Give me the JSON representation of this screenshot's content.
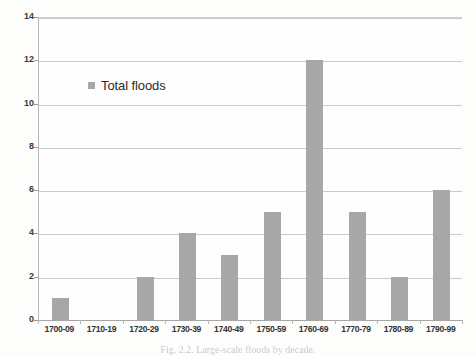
{
  "figure": {
    "caption": "Fig. 2.2. Large-scale floods by decade.",
    "background_color": "#fdfdfc"
  },
  "legend": {
    "position": "inside-top-left",
    "entries": [
      {
        "label": "Total floods",
        "color": "#a7a7a7",
        "marker": "square"
      }
    ]
  },
  "chart_data": {
    "type": "bar",
    "title": "",
    "xlabel": "",
    "ylabel": "",
    "categories": [
      "1700-09",
      "1710-19",
      "1720-29",
      "1730-39",
      "1740-49",
      "1750-59",
      "1760-69",
      "1770-79",
      "1780-89",
      "1790-99"
    ],
    "series": [
      {
        "name": "Total floods",
        "color": "#a7a7a7",
        "values": [
          1,
          0,
          2,
          4,
          3,
          5,
          12,
          5,
          2,
          6
        ]
      }
    ],
    "values": [
      1,
      0,
      2,
      4,
      3,
      5,
      12,
      5,
      2,
      6
    ],
    "ylim": [
      0,
      14
    ],
    "yticks": [
      0,
      2,
      4,
      6,
      8,
      10,
      12,
      14
    ],
    "ytick_labels": [
      "0",
      "2",
      "4",
      "6",
      "8",
      "10",
      "12",
      "14"
    ],
    "grid": "horizontal",
    "legend_position": "inside-top-left",
    "bar_color": "#a7a7a7",
    "gridline_color": "#c9c9c9",
    "axis_color": "#a6a6a6"
  }
}
